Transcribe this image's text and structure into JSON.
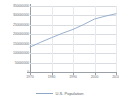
{
  "chart_data": {
    "type": "line",
    "title": "",
    "subtitle": "",
    "xlabel": "",
    "ylabel": "",
    "grid": true,
    "legend_position": "bottom",
    "xlim": [
      1970,
      2010
    ],
    "ylim": [
      0,
      350000000
    ],
    "x_ticks": [
      "1970",
      "1980",
      "1990",
      "2000",
      "2010"
    ],
    "x_tick_values": [
      1970,
      1980,
      1990,
      2000,
      2010
    ],
    "y_ticks": [
      "350000000",
      "300000000",
      "250000000",
      "200000000",
      "150000000",
      "100000000",
      "50000000",
      "0"
    ],
    "y_tick_values": [
      350000000,
      300000000,
      250000000,
      200000000,
      150000000,
      100000000,
      50000000,
      0
    ],
    "series": [
      {
        "name": "U.S. Population",
        "color": "#8fa8c8",
        "x": [
          1970,
          1975,
          1980,
          1985,
          1990,
          1995,
          2000,
          2005,
          2010
        ],
        "values": [
          132000000,
          158000000,
          182000000,
          205000000,
          226000000,
          252000000,
          281000000,
          296000000,
          309000000
        ]
      }
    ],
    "annotations": []
  },
  "legend": {
    "label": "U.S. Population",
    "swatch_color": "#8fa8c8"
  },
  "colors": {
    "series": "#8fa8c8",
    "grid": "#d9dde2",
    "axis": "#9aa0a6",
    "tick_text": "#6b7076",
    "background": "#ffffff"
  }
}
